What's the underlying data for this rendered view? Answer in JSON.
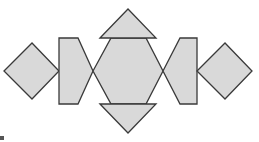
{
  "diagram": {
    "colors": {
      "fill": "#d9d9d9",
      "stroke": "#3a3a3a",
      "background": "#ffffff"
    },
    "shapes": [
      {
        "name": "left-square",
        "points": "4,71 32,43 59,71 32,99"
      },
      {
        "name": "left-trapezoid",
        "points": "59,38 78,38 93,71 78,104 59,104"
      },
      {
        "name": "center-hexagon",
        "points": "93,71 111,38 146,38 163,71 146,104 111,104"
      },
      {
        "name": "top-triangle",
        "points": "100,38 128,9 156,38"
      },
      {
        "name": "bottom-triangle",
        "points": "100,104 128,133 156,104"
      },
      {
        "name": "right-trapezoid",
        "points": "163,71 180,38 197,38 197,104 180,104"
      },
      {
        "name": "right-square",
        "points": "197,71 225,43 252,71 225,99"
      }
    ]
  }
}
